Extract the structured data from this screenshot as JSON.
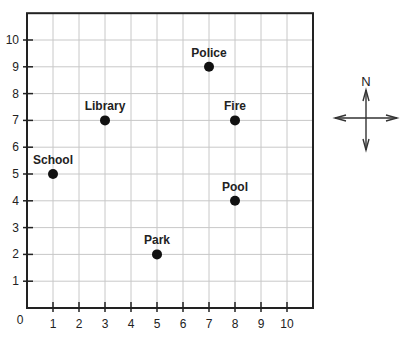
{
  "chart_data": {
    "type": "scatter",
    "title": "",
    "xlabel": "",
    "ylabel": "",
    "xlim": [
      0,
      11
    ],
    "ylim": [
      0,
      11
    ],
    "grid": true,
    "origin_label": "0",
    "x_ticks": [
      1,
      2,
      3,
      4,
      5,
      6,
      7,
      8,
      9,
      10
    ],
    "y_ticks": [
      1,
      2,
      3,
      4,
      5,
      6,
      7,
      8,
      9,
      10
    ],
    "points": [
      {
        "label": "Police",
        "x": 7,
        "y": 9
      },
      {
        "label": "Library",
        "x": 3,
        "y": 7
      },
      {
        "label": "Fire",
        "x": 8,
        "y": 7
      },
      {
        "label": "School",
        "x": 1,
        "y": 5
      },
      {
        "label": "Pool",
        "x": 8,
        "y": 4
      },
      {
        "label": "Park",
        "x": 5,
        "y": 2
      }
    ],
    "compass": {
      "label": "N"
    }
  },
  "colors": {
    "grid": "#c8c8c8",
    "axis": "#222222",
    "point": "#111111"
  }
}
